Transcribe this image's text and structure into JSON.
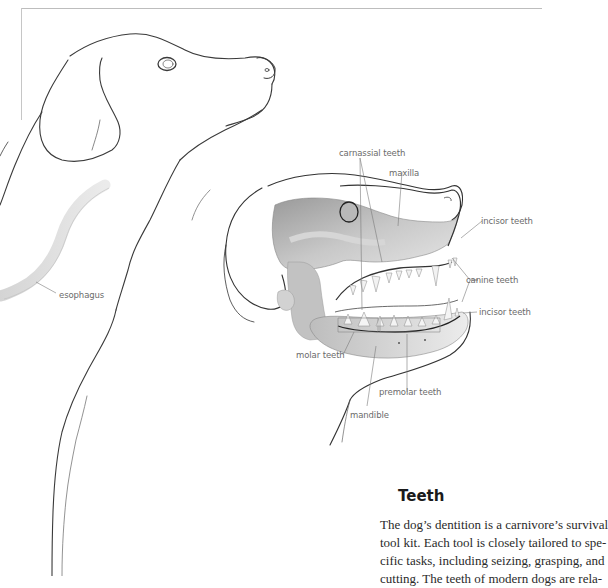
{
  "illustration": {
    "subject": "dog head outline with skull cutaway",
    "labels": {
      "carnassial": "carnassial teeth",
      "maxilla": "maxilla",
      "incisor_upper": "incisor teeth",
      "canine": "canine teeth",
      "incisor_lower": "incisor teeth",
      "molar": "molar teeth",
      "premolar": "premolar teeth",
      "mandible": "mandible",
      "esophagus": "esophagus"
    }
  },
  "section": {
    "heading": "Teeth",
    "body_lines": [
      "The dog’s dentition is a carnivore’s survival",
      "tool kit. Each tool is closely tailored to spe-",
      "cific tasks, including seizing, grasping, and",
      "cutting. The teeth of modern dogs are rela-"
    ]
  }
}
